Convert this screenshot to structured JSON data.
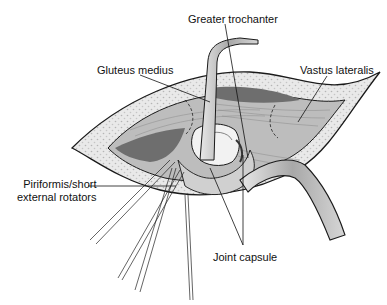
{
  "figure": {
    "type": "surgical anatomical illustration",
    "labels": {
      "greater_trochanter": "Greater trochanter",
      "gluteus_medius": "Gluteus medius",
      "vastus_lateralis": "Vastus lateralis",
      "piriformis_line1": "Piriformis/short",
      "piriformis_line2": "external rotators",
      "joint_capsule": "Joint capsule"
    },
    "colors": {
      "skin_outline": "#1a1a1a",
      "fat_layer": "#e6e6e6",
      "muscle": "#bdbdbd",
      "dark_cavity": "#6e6e6e",
      "bone": "#f2f2f2",
      "retractor": "#cfcfcf"
    }
  }
}
